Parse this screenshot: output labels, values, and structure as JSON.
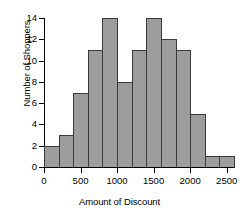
{
  "chart_data": {
    "type": "bar",
    "title": "",
    "xlabel": "Amount of Discount",
    "ylabel": "Number of Shoppers",
    "categories": [
      "0-200",
      "200-400",
      "400-600",
      "600-800",
      "800-1000",
      "1000-1200",
      "1200-1400",
      "1400-1600",
      "1600-1800",
      "1800-2000",
      "2000-2200",
      "2200-2400",
      "2400-2600"
    ],
    "bin_edges": [
      0,
      200,
      400,
      600,
      800,
      1000,
      1200,
      1400,
      1600,
      1800,
      2000,
      2200,
      2400,
      2600
    ],
    "bin_width": 200,
    "values": [
      2,
      3,
      7,
      11,
      14,
      8,
      11,
      14,
      12,
      11,
      5,
      1,
      1
    ],
    "xlim": [
      0,
      2600
    ],
    "ylim": [
      0,
      14
    ],
    "x_ticks": [
      0,
      500,
      1000,
      1500,
      2000,
      2500
    ],
    "x_tick_labels": [
      "0",
      "500",
      "1000",
      "1500",
      "2000",
      "2500"
    ],
    "y_ticks": [
      0,
      2,
      4,
      6,
      8,
      10,
      12,
      14
    ],
    "y_tick_labels": [
      "0",
      "2",
      "4",
      "6",
      "8",
      "10",
      "12",
      "14"
    ],
    "grid": false,
    "legend": false,
    "bar_fill_color": "#9d9d9d",
    "bar_edge_color": "#3a3a3a",
    "axis_color": "#000000",
    "background_color": "#ffffff"
  }
}
